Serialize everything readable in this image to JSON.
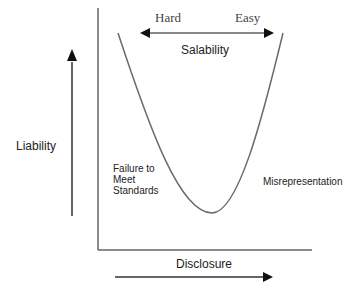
{
  "diagram": {
    "top_arrow": {
      "left_label": "Hard",
      "right_label": "Easy",
      "title": "Salability"
    },
    "y_axis_label": "Liability",
    "x_axis_label": "Disclosure",
    "left_region_label": "Failure to\nMeet\nStandards",
    "left_region_lines": [
      "Failure to",
      "Meet",
      "Standards"
    ],
    "right_region_label": "Misrepresentation",
    "colors": {
      "axis": "#555555",
      "curve": "#6a6a6a",
      "arrow": "#111111"
    }
  }
}
